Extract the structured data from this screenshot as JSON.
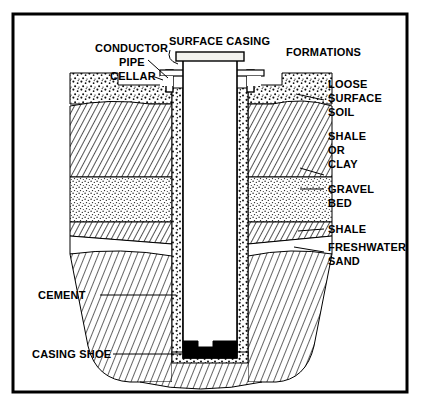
{
  "figure": {
    "border_color": "#000000",
    "background_color": "#ffffff",
    "ink_color": "#000000"
  },
  "labels": {
    "conductor_pipe_line1": "CONDUCTOR",
    "conductor_pipe_line2": "PIPE",
    "surface_casing": "SURFACE CASING",
    "cellar": "CELLAR",
    "formations": "FORMATIONS",
    "loose_surface_soil_line1": "LOOSE",
    "loose_surface_soil_line2": "SURFACE",
    "loose_surface_soil_line3": "SOIL",
    "shale_or_clay_line1": "SHALE",
    "shale_or_clay_line2": "OR",
    "shale_or_clay_line3": "CLAY",
    "gravel_bed_line1": "GRAVEL",
    "gravel_bed_line2": "BED",
    "shale": "SHALE",
    "freshwater_sand_line1": "FRESHWATER",
    "freshwater_sand_line2": "SAND",
    "cement": "CEMENT",
    "casing_shoe": "CASING SHOE"
  },
  "strata": [
    {
      "name": "loose-surface-soil",
      "label": "LOOSE SURFACE SOIL",
      "pattern": "coarse-stipple"
    },
    {
      "name": "shale-or-clay",
      "label": "SHALE OR CLAY",
      "pattern": "diagonal-hatch"
    },
    {
      "name": "gravel-bed",
      "label": "GRAVEL BED",
      "pattern": "fine-stipple"
    },
    {
      "name": "shale",
      "label": "SHALE",
      "pattern": "diagonal-hatch"
    },
    {
      "name": "freshwater-sand",
      "label": "FRESHWATER SAND",
      "pattern": "blank"
    },
    {
      "name": "deep-formations",
      "label": "FORMATIONS",
      "pattern": "diagonal-hatch"
    }
  ],
  "components": [
    {
      "name": "conductor-pipe",
      "label": "CONDUCTOR PIPE"
    },
    {
      "name": "surface-casing",
      "label": "SURFACE CASING"
    },
    {
      "name": "cellar",
      "label": "CELLAR"
    },
    {
      "name": "cement",
      "label": "CEMENT",
      "pattern": "pebble-stipple"
    },
    {
      "name": "casing-shoe",
      "label": "CASING SHOE",
      "fill": "#000000"
    }
  ]
}
